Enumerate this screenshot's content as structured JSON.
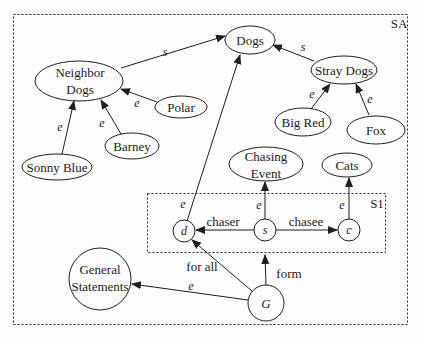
{
  "diagram": {
    "colors": {
      "stroke": "#1f1f1f",
      "background": "#fcfcfc",
      "text": "#1c1c1c"
    },
    "regions": {
      "outer": "SA",
      "inner": "S1"
    },
    "nodes": {
      "dogs": "Dogs",
      "neighbor_dogs": {
        "line1": "Neighbor",
        "line2": "Dogs"
      },
      "stray_dogs": "Stray Dogs",
      "polar": "Polar",
      "barney": "Barney",
      "sonny_blue": "Sonny Blue",
      "big_red": "Big Red",
      "fox": "Fox",
      "chasing_event": {
        "line1": "Chasing",
        "line2": "Event"
      },
      "cats": "Cats",
      "general_statements": {
        "line1": "General",
        "line2": "Statements"
      },
      "d": "d",
      "s": "s",
      "c": "c",
      "g": "G"
    },
    "edge_labels": {
      "neighbor_dogs_to_dogs": "s",
      "stray_dogs_to_dogs": "s",
      "polar_to_neighbor_dogs": "e",
      "barney_to_neighbor_dogs": "e",
      "sonny_blue_to_neighbor_dogs": "e",
      "big_red_to_stray_dogs": "e",
      "fox_to_stray_dogs": "e",
      "d_to_dogs": "e",
      "s_to_chasing_event": "e",
      "c_to_cats": "e",
      "s_to_d": "chaser",
      "s_to_c": "chasee",
      "g_to_s": "form",
      "g_to_d": "for all",
      "g_to_general_statements": "e"
    }
  }
}
